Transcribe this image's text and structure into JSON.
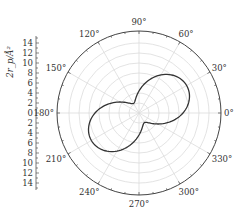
{
  "chart_data": {
    "type": "polar-line",
    "title": "",
    "ylabel": "2r_p/Å²",
    "radial_axis": {
      "ticks_upper": [
        "14",
        "12",
        "10",
        "8",
        "6",
        "4",
        "2",
        "0"
      ],
      "ticks_lower": [
        "2",
        "4",
        "6",
        "8",
        "10",
        "12",
        "14"
      ],
      "range": [
        0,
        16
      ]
    },
    "angular_ticks": [
      "0°",
      "30°",
      "60°",
      "90°",
      "120°",
      "150°",
      "180°",
      "210°",
      "240°",
      "270°",
      "300°",
      "330°"
    ],
    "grid": true,
    "series": [
      {
        "name": "curve",
        "description": "peanut-shaped two-lobe curve, lobes oriented along 30°/210°, pinch near 120°/300°",
        "theta_deg": [
          0,
          30,
          60,
          90,
          120,
          150,
          180,
          210,
          240,
          270,
          300,
          330
        ],
        "r": [
          8.8,
          11.0,
          8.8,
          4.4,
          2.2,
          4.4,
          8.8,
          11.0,
          8.8,
          4.4,
          2.2,
          4.4
        ]
      }
    ]
  }
}
